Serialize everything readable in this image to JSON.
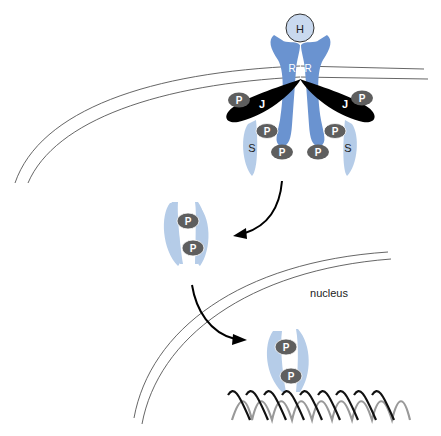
{
  "diagram": {
    "colors": {
      "receptor": "#6a93d0",
      "stat": "#b5cce8",
      "jak": "#000000",
      "phosphate": "#5e5e5e",
      "hormone_fill": "#c9d9ef",
      "membrane": "#555555",
      "dna_front": "#111111",
      "dna_back": "#999999"
    },
    "labels": {
      "hormone": "H",
      "receptor_left": "R",
      "receptor_right": "R",
      "jak_left": "J",
      "jak_right": "J",
      "stat_left": "S",
      "stat_right": "S",
      "phosphate": "P",
      "nucleus": "nucleus"
    },
    "nodes": [
      {
        "id": "hormone",
        "label": "H",
        "type": "ligand"
      },
      {
        "id": "receptor-dimer",
        "label": "R R",
        "type": "membrane-receptor"
      },
      {
        "id": "jak-left",
        "label": "J",
        "type": "kinase"
      },
      {
        "id": "jak-right",
        "label": "J",
        "type": "kinase"
      },
      {
        "id": "stat-left",
        "label": "S",
        "type": "transcription-factor"
      },
      {
        "id": "stat-right",
        "label": "S",
        "type": "transcription-factor"
      },
      {
        "id": "stat-dimer-cytoplasm",
        "label": "P P",
        "type": "phosphorylated-dimer"
      },
      {
        "id": "stat-dimer-nucleus",
        "label": "P P",
        "type": "phosphorylated-dimer"
      },
      {
        "id": "dna",
        "label": "",
        "type": "dna-helix"
      }
    ],
    "edges": [
      {
        "from": "receptor-dimer",
        "to": "stat-dimer-cytoplasm",
        "type": "arrow"
      },
      {
        "from": "stat-dimer-cytoplasm",
        "to": "stat-dimer-nucleus",
        "type": "arrow"
      }
    ]
  }
}
